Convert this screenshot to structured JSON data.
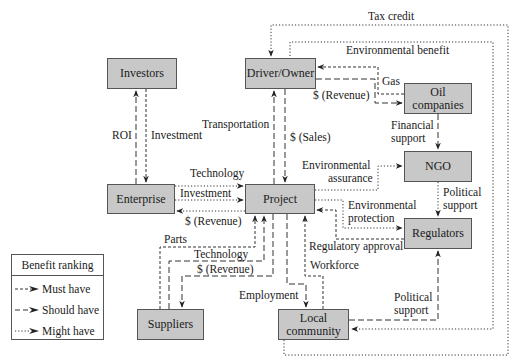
{
  "nodes": {
    "investors": "Investors",
    "driver_owner": "Driver/Owner",
    "oil_companies": "Oil companies",
    "ngo": "NGO",
    "enterprise": "Enterprise",
    "project": "Project",
    "regulators": "Regulators",
    "suppliers": "Suppliers",
    "local_community_line1": "Local",
    "local_community_line2": "community"
  },
  "edges": {
    "tax_credit": "Tax credit",
    "environmental_benefit": "Environmental benefit",
    "gas": "Gas",
    "revenue_driver": "$ (Revenue)",
    "roi": "ROI",
    "investment_investors": "Investment",
    "transportation": "Transportation",
    "sales": "$ (Sales)",
    "financial_support_line1": "Financial",
    "financial_support_line2": "support",
    "environmental_assurance_line1": "Environmental",
    "environmental_assurance_line2": "assurance",
    "technology_enterprise": "Technology",
    "investment_enterprise": "Investment",
    "revenue_enterprise": "$ (Revenue)",
    "political_support_ngo_line1": "Political",
    "political_support_ngo_line2": "support",
    "environmental_protection_line1": "Environmental",
    "environmental_protection_line2": "protection",
    "regulatory_approval": "Regulatory approval",
    "workforce": "Workforce",
    "parts": "Parts",
    "technology_suppliers": "Technology",
    "revenue_suppliers": "$ (Revenue)",
    "employment": "Employment",
    "political_support_community_line1": "Political",
    "political_support_community_line2": "support"
  },
  "legend": {
    "title": "Benefit ranking",
    "items": [
      {
        "label": "Must have",
        "style": "short-dash"
      },
      {
        "label": "Should have",
        "style": "long-dash"
      },
      {
        "label": "Might have",
        "style": "dotted"
      }
    ]
  },
  "colors": {
    "node_fill": "#c8c8c8",
    "node_border": "#555555",
    "line": "#333333"
  }
}
